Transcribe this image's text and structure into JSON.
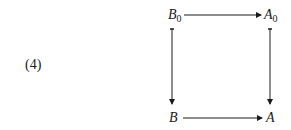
{
  "equation_number": "(4)",
  "nodes": {
    "top_left": {
      "base": "B",
      "sub": "0"
    },
    "top_right": {
      "base": "A",
      "sub": "0"
    },
    "bottom_left": {
      "base": "B",
      "sub": ""
    },
    "bottom_right": {
      "base": "A",
      "sub": ""
    }
  },
  "edges": [
    {
      "from": "B0",
      "to": "A0",
      "direction": "right"
    },
    {
      "from": "B0",
      "to": "B",
      "direction": "down"
    },
    {
      "from": "A0",
      "to": "A",
      "direction": "down"
    },
    {
      "from": "B",
      "to": "A",
      "direction": "right"
    }
  ]
}
